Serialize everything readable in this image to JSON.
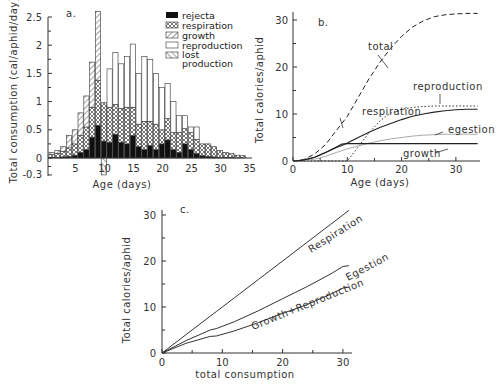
{
  "chart_data": [
    {
      "panel": "a.",
      "type": "bar",
      "stacked": true,
      "xlabel": "Age (days)",
      "ylabel": "Total consumption (cal/aphid/day)",
      "ylim": [
        -0.3,
        2.5
      ],
      "yticks": [
        "-0.3",
        "0",
        "0.5",
        "1",
        "1.5",
        "2",
        "2.5"
      ],
      "xticks": [
        "5",
        "10",
        "15",
        "20",
        "25",
        "30",
        "35"
      ],
      "legend": [
        "rejecta",
        "respiration",
        "growth",
        "reproduction",
        "lost production"
      ],
      "categories": [
        1,
        2,
        3,
        4,
        5,
        6,
        7,
        8,
        9,
        10,
        11,
        12,
        13,
        14,
        15,
        16,
        17,
        18,
        19,
        20,
        21,
        22,
        23,
        24,
        25,
        26,
        27,
        28,
        29,
        30,
        31,
        32,
        33,
        34
      ],
      "series": [
        {
          "name": "rejecta",
          "values": [
            0.01,
            0.01,
            0.02,
            0.03,
            0.05,
            0.1,
            0.15,
            0.37,
            0.58,
            0.3,
            0.28,
            0.42,
            0.28,
            0.25,
            0.4,
            0.2,
            0.15,
            0.22,
            0.15,
            0.25,
            0.32,
            0.15,
            0.1,
            0.25,
            0.15,
            0.08,
            0.04,
            0.03,
            0.02,
            0.01,
            0.01,
            0.01,
            0.0,
            0.0
          ]
        },
        {
          "name": "respiration",
          "values": [
            0.05,
            0.07,
            0.1,
            0.15,
            0.2,
            0.3,
            0.4,
            0.53,
            0.8,
            0.68,
            0.62,
            0.53,
            0.6,
            0.65,
            0.5,
            0.4,
            0.5,
            0.43,
            0.45,
            0.25,
            0.38,
            0.3,
            0.35,
            0.27,
            0.3,
            0.25,
            0.21,
            0.22,
            0.18,
            0.12,
            0.09,
            0.07,
            0.05,
            0.04
          ]
        },
        {
          "name": "growth",
          "values": [
            0.04,
            0.05,
            0.08,
            0.22,
            0.25,
            0.4,
            0.55,
            0.8,
            1.22,
            0.0,
            0.0,
            0.0,
            0.0,
            0.0,
            0.0,
            0.0,
            0.0,
            0.0,
            0.0,
            0.0,
            0.0,
            0.0,
            0.0,
            0.0,
            0.0,
            0.0,
            0.0,
            0.0,
            0.0,
            0.0,
            0.0,
            0.0,
            0.0,
            0.0
          ]
        },
        {
          "name": "reproduction",
          "values": [
            0,
            0,
            0,
            0,
            0,
            0,
            0,
            0,
            0,
            0,
            0.68,
            0.92,
            0.79,
            0.9,
            1.12,
            0.9,
            1.15,
            1.1,
            0.9,
            0.75,
            0.62,
            0.55,
            0.3,
            0.23,
            0.1,
            0.22,
            0,
            0,
            0,
            0,
            0,
            0,
            0,
            0
          ]
        },
        {
          "name": "lost production",
          "values": [
            0,
            0,
            0,
            0,
            0,
            0,
            0,
            0,
            0,
            -0.3,
            0,
            0,
            0,
            0,
            0,
            0,
            0,
            0,
            0,
            0,
            0,
            0,
            0,
            0,
            0,
            0,
            0,
            0,
            0,
            0,
            0,
            0,
            0,
            0
          ]
        }
      ]
    },
    {
      "panel": "b.",
      "type": "line",
      "xlabel": "Age (days)",
      "ylabel": "Total calories/aphid",
      "xlim": [
        0,
        34
      ],
      "ylim": [
        0,
        32
      ],
      "xticks": [
        "0",
        "10",
        "20",
        "30"
      ],
      "yticks": [
        "0",
        "10",
        "20",
        "30"
      ],
      "x": [
        0,
        2,
        4,
        6,
        8,
        9,
        10,
        12,
        14,
        16,
        18,
        20,
        22,
        24,
        26,
        28,
        30,
        32,
        34
      ],
      "series": [
        {
          "name": "total",
          "style": "dashed",
          "values": [
            0,
            0.3,
            1.5,
            3.5,
            6.5,
            8,
            9.5,
            13.5,
            17.5,
            21,
            24,
            26.5,
            28.5,
            29.8,
            30.7,
            31.1,
            31.3,
            31.4,
            31.4
          ]
        },
        {
          "name": "respiration",
          "style": "solid",
          "values": [
            0,
            0.2,
            0.8,
            1.8,
            2.9,
            3.3,
            3.8,
            5,
            6.1,
            7.1,
            8,
            8.8,
            9.5,
            10,
            10.4,
            10.7,
            10.9,
            11,
            11
          ]
        },
        {
          "name": "reproduction",
          "style": "dotted",
          "values": [
            0,
            0,
            0,
            0,
            0,
            0,
            0,
            3,
            6,
            8.5,
            10.2,
            11,
            11.4,
            11.6,
            11.7,
            11.7,
            11.7,
            11.7,
            11.7
          ]
        },
        {
          "name": "egestion",
          "style": "light",
          "values": [
            0,
            0.1,
            0.4,
            1,
            1.8,
            2.2,
            2.6,
            3.2,
            3.8,
            4.3,
            4.7,
            5,
            5.3,
            5.5,
            5.6,
            5.7,
            5.7,
            5.7,
            5.7
          ]
        },
        {
          "name": "growth",
          "style": "solid",
          "values": [
            0,
            0.2,
            0.8,
            1.8,
            3,
            3.6,
            3.7,
            3.7,
            3.7,
            3.7,
            3.7,
            3.7,
            3.7,
            3.7,
            3.7,
            3.7,
            3.7,
            3.7,
            3.7
          ]
        }
      ],
      "annotations": [
        "total",
        "reproduction",
        "respiration",
        "egestion",
        "growth"
      ]
    },
    {
      "panel": "c.",
      "type": "line",
      "xlabel": "total consumption",
      "ylabel": "Total calories/aphid",
      "xlim": [
        0,
        31
      ],
      "ylim": [
        0,
        31
      ],
      "xticks": [
        "0",
        "10",
        "20",
        "30"
      ],
      "yticks": [
        "0",
        "10",
        "20",
        "30"
      ],
      "x": [
        0,
        4,
        8,
        9,
        12,
        16,
        20,
        24,
        28,
        30,
        31
      ],
      "series": [
        {
          "name": "Respiration",
          "values": [
            0,
            4,
            8,
            9,
            12,
            16,
            20,
            24,
            28,
            30,
            31
          ]
        },
        {
          "name": "Egestion",
          "values": [
            0,
            2.7,
            5,
            5.3,
            6.8,
            9.2,
            11.8,
            14.4,
            17.2,
            18.8,
            19
          ]
        },
        {
          "name": "Growth+Reproduction",
          "values": [
            0,
            2.1,
            3.6,
            3.7,
            4.8,
            6.6,
            8.6,
            10.5,
            12.8,
            14.1,
            14.3
          ]
        }
      ]
    }
  ],
  "labels": {
    "a_panel": "a.",
    "b_panel": "b.",
    "c_panel": "c.",
    "a_ylabel": "Total consumption (cal/aphid/day)",
    "a_xlabel": "Age (days)",
    "b_ylabel": "Total calories/aphid",
    "b_xlabel": "Age (days)",
    "c_ylabel": "Total calories/aphid",
    "c_xlabel": "total consumption",
    "legend": [
      "rejecta",
      "respiration",
      "growth",
      "reproduction",
      "lost",
      "production"
    ],
    "b_total": "total",
    "b_reproduction": "reproduction",
    "b_respiration": "respiration",
    "b_egestion": "egestion",
    "b_growth": "growth",
    "c_resp": "Respiration",
    "c_eges": "Egestion",
    "c_gr": "Growth+Reproduction"
  }
}
